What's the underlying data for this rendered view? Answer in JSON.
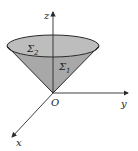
{
  "diagram": {
    "type": "3d-cone-surface",
    "axes": {
      "z_label": "z",
      "y_label": "y",
      "x_label": "x",
      "origin_label": "O"
    },
    "surfaces": {
      "top_disk_label": "Σ",
      "top_disk_sub": "2",
      "cone_label": "Σ",
      "cone_sub": "1"
    },
    "colors": {
      "fill": "#b4b4b4",
      "stroke": "#2a2a2a",
      "background": "#ffffff"
    }
  }
}
